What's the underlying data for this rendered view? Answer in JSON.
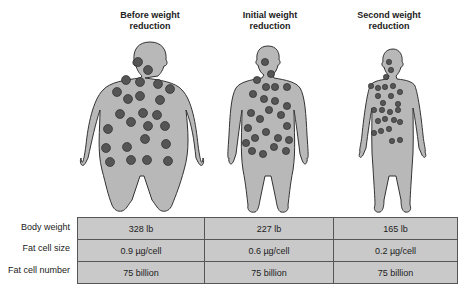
{
  "headings": [
    {
      "line1": "Before weight",
      "line2": "reduction"
    },
    {
      "line1": "Initial weight",
      "line2": "reduction"
    },
    {
      "line1": "Second weight",
      "line2": "reduction"
    }
  ],
  "table": {
    "row_labels": [
      "Body weight",
      "Fat cell size",
      "Fat cell number"
    ],
    "columns": [
      "Before weight reduction",
      "Initial weight reduction",
      "Second weight reduction"
    ],
    "rows": [
      [
        "328 lb",
        "227 lb",
        "165 lb"
      ],
      [
        "0.9 µg/cell",
        "0.6 µg/cell",
        "0.2 µg/cell"
      ],
      [
        "75 billion",
        "75 billion",
        "75 billion"
      ]
    ]
  },
  "colors": {
    "body_fill": "#b8b8b8",
    "outline": "#333333",
    "fat_cell": "#555555",
    "table_fill": "#c9c9c9"
  }
}
